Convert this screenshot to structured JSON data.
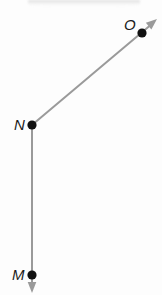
{
  "figure": {
    "background_color": "#fdfdfd",
    "width": 162,
    "height": 295,
    "line_color": "#9a9a9a",
    "point_color": "#111111",
    "label_color": "#1b1b1b",
    "top_band": {
      "name": "top-shadow-band",
      "color": "#c9c9c9"
    },
    "points": [
      {
        "id": "M",
        "label": "M",
        "x": 32,
        "y": 275,
        "label_x": 12,
        "label_y": 267
      },
      {
        "id": "N",
        "label": "N",
        "x": 32,
        "y": 125,
        "label_x": 14,
        "label_y": 117
      },
      {
        "id": "O",
        "label": "O",
        "x": 142,
        "y": 33,
        "label_x": 124,
        "label_y": 17
      }
    ],
    "rays": [
      {
        "id": "ray-NO",
        "from": "N",
        "through": "O",
        "x1": 32,
        "y1": 125,
        "x2": 153,
        "y2": 23,
        "arrow_tip_x": 157,
        "arrow_tip_y": 19,
        "has_arrowhead": true
      },
      {
        "id": "ray-NM",
        "from": "N",
        "through": "M",
        "x1": 32,
        "y1": 125,
        "x2": 32,
        "y2": 288,
        "arrow_tip_x": 32,
        "arrow_tip_y": 293,
        "has_arrowhead": true
      }
    ],
    "vertex": "N",
    "labels": {
      "M": "M",
      "N": "N",
      "O": "O"
    }
  }
}
